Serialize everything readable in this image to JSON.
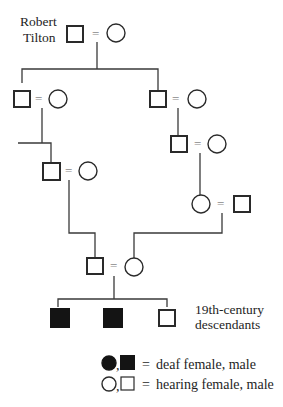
{
  "diagram": {
    "type": "pedigree",
    "founder": {
      "label_line1": "Robert",
      "label_line2": "Tilton"
    },
    "marriage_symbol": "=",
    "descendants_label_line1": "19th-century",
    "descendants_label_line2": "descendants",
    "generations": [
      {
        "gen": 1,
        "couples": [
          {
            "male": "hearing",
            "female": "hearing",
            "note": "Robert Tilton and spouse"
          }
        ]
      },
      {
        "gen": 2,
        "couples": [
          {
            "male": "hearing",
            "female": "hearing"
          },
          {
            "male": "hearing",
            "female": "hearing"
          }
        ]
      },
      {
        "gen": 3,
        "couples": [
          {
            "male": "hearing",
            "female": "hearing"
          },
          {
            "male": "hearing",
            "female": "hearing"
          }
        ]
      },
      {
        "gen": 4,
        "couples": [
          {
            "female": "hearing",
            "male": "hearing"
          }
        ]
      },
      {
        "gen": 5,
        "couples": [
          {
            "male": "hearing",
            "female": "hearing"
          }
        ]
      },
      {
        "gen": 6,
        "children": [
          {
            "sex": "male",
            "status": "deaf"
          },
          {
            "sex": "male",
            "status": "deaf"
          },
          {
            "sex": "male",
            "status": "hearing"
          }
        ]
      }
    ],
    "legend": {
      "row1_separator": ",",
      "row1_equals": "=",
      "row1_text": "deaf female, male",
      "row2_separator": ",",
      "row2_equals": "=",
      "row2_text": "hearing female, male"
    },
    "colors": {
      "line": "#3a3a3a",
      "symbol_stroke": "#2a2a2a",
      "filled": "#141414",
      "background": "#ffffff"
    }
  }
}
